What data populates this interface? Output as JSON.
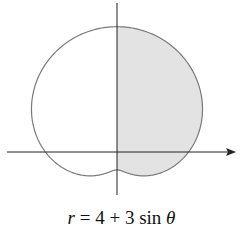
{
  "chart_data": {
    "type": "polar-curve",
    "title": "",
    "equation": "r = 4 + 3 sin θ",
    "equation_parts": {
      "r": "r",
      "rhs": " = 4 + 3 sin ",
      "theta": "θ"
    },
    "a": 4,
    "b": 3,
    "shaded_region": "right half (x ≥ 0), -π/2 ≤ θ ≤ π/2",
    "r_max": 7,
    "r_min": 1,
    "axes": {
      "horizontal_arrow": true,
      "vertical_arrow": false,
      "grid": false,
      "ticks": false
    },
    "colors": {
      "curve": "#7a7a7a",
      "fill": "#e3e3e3",
      "axis": "#222222"
    }
  }
}
